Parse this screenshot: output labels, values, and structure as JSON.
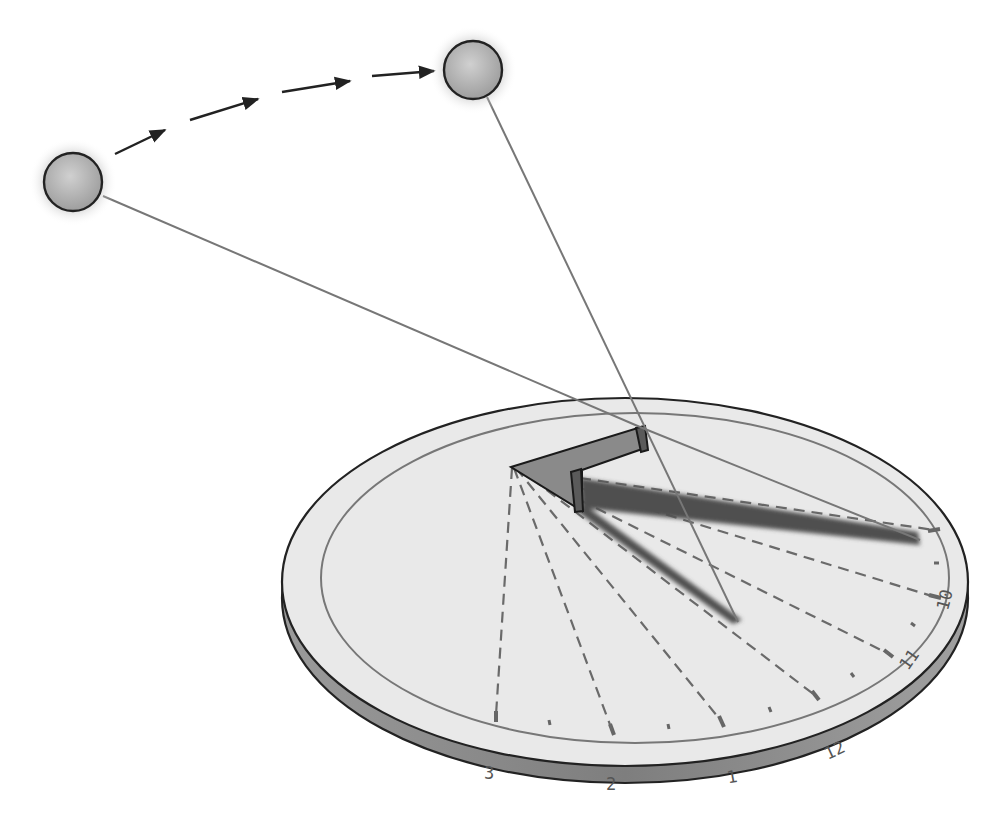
{
  "diagram": {
    "type": "sundial-illustration",
    "colors": {
      "background": "#ffffff",
      "dial_face": "#e8e8e8",
      "dial_edge": "#8a8a8a",
      "outline": "#222222",
      "ring": "#777777",
      "gnomon": "#8c8c8c",
      "shadow": "#555555",
      "dashed_lines": "#6a6a6a",
      "sun_fill": "#bdbdbd",
      "ray": "#777777"
    },
    "suns": [
      {
        "label": "sun-earlier",
        "cx": 73,
        "cy": 182,
        "r": 29
      },
      {
        "label": "sun-later",
        "cx": 473,
        "cy": 70,
        "r": 29
      }
    ],
    "path_arrows": 4,
    "hour_labels": [
      {
        "text": "3",
        "x": 491,
        "y": 779,
        "rot": 0
      },
      {
        "text": "2",
        "x": 612,
        "y": 790,
        "rot": 0
      },
      {
        "text": "1",
        "x": 731,
        "y": 783,
        "rot": -10
      },
      {
        "text": "12",
        "x": 837,
        "y": 755,
        "rot": -25
      },
      {
        "text": "11",
        "x": 910,
        "y": 660,
        "rot": -55
      },
      {
        "text": "10",
        "x": 945,
        "y": 600,
        "rot": -75
      }
    ]
  }
}
